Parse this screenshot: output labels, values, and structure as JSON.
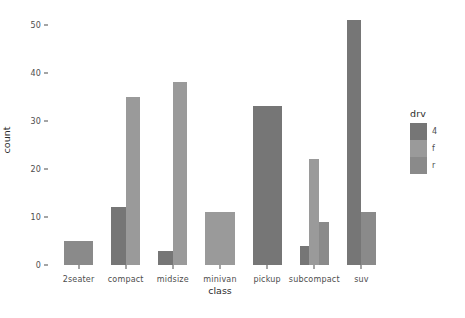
{
  "chart_data": {
    "type": "bar",
    "title": "",
    "subtitle": "",
    "xlabel": "class",
    "ylabel": "count",
    "categories": [
      "2seater",
      "compact",
      "midsize",
      "minivan",
      "pickup",
      "subcompact",
      "suv"
    ],
    "series": [
      {
        "name": "4",
        "color": "#767676",
        "values": [
          0,
          12,
          3,
          0,
          33,
          4,
          51
        ]
      },
      {
        "name": "f",
        "color": "#9a9a9a",
        "values": [
          0,
          35,
          38,
          11,
          0,
          22,
          0
        ]
      },
      {
        "name": "r",
        "color": "#8a8a8a",
        "values": [
          5,
          0,
          0,
          0,
          0,
          9,
          11
        ]
      }
    ],
    "ylim": [
      0,
      52
    ],
    "yticks": [
      0,
      10,
      20,
      30,
      40,
      50
    ],
    "ytick_labels": [
      "0",
      "10",
      "20",
      "30",
      "40",
      "50"
    ],
    "grid": false,
    "bar_mode": "dodge",
    "legend": {
      "title": "drv",
      "position": "right",
      "entries": [
        {
          "label": "4",
          "color": "#767676"
        },
        {
          "label": "f",
          "color": "#9a9a9a"
        },
        {
          "label": "r",
          "color": "#8a8a8a"
        }
      ]
    },
    "panel_background": "#ffffff",
    "axis_text_color": "#4d4d4d"
  },
  "axes": {
    "y_title": "count",
    "x_title": "class"
  }
}
